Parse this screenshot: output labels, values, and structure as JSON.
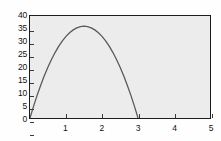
{
  "chart_data": {
    "type": "line",
    "title": "",
    "xlabel": "",
    "ylabel": "",
    "xlim": [
      0,
      5
    ],
    "ylim": [
      0,
      40
    ],
    "grid": false,
    "legend": null,
    "x_ticks": [
      "1",
      "2",
      "3",
      "4",
      "5"
    ],
    "x_tick_values": [
      1,
      2,
      3,
      4,
      5
    ],
    "y_ticks": [
      "0",
      "5",
      "10",
      "15",
      "20",
      "25",
      "30",
      "35",
      "40"
    ],
    "y_tick_values": [
      0,
      5,
      10,
      15,
      20,
      25,
      30,
      35,
      40
    ],
    "series": [
      {
        "name": "curve",
        "color": "#5a5a5a",
        "equation": "y = 16x(3 - x)",
        "x": [
          0,
          0.1,
          0.2,
          0.3,
          0.4,
          0.5,
          0.6,
          0.7,
          0.8,
          0.9,
          1.0,
          1.1,
          1.2,
          1.3,
          1.4,
          1.5,
          1.6,
          1.7,
          1.8,
          1.9,
          2.0,
          2.1,
          2.2,
          2.3,
          2.4,
          2.5,
          2.6,
          2.7,
          2.8,
          2.9,
          3.0
        ],
        "values": [
          0,
          4.64,
          8.96,
          12.96,
          16.64,
          20,
          23.04,
          25.76,
          28.16,
          30.24,
          32,
          33.44,
          34.56,
          35.36,
          35.84,
          36,
          35.84,
          35.36,
          34.56,
          33.44,
          32,
          30.24,
          28.16,
          25.76,
          23.04,
          20,
          16.64,
          12.96,
          8.96,
          4.64,
          0
        ]
      }
    ],
    "peak": {
      "x": 1.5,
      "y": 36
    },
    "roots": [
      0,
      3
    ]
  },
  "style": {
    "plot_background": "#ececec",
    "frame_color": "#1c1c1c",
    "curve_color": "#5a5a5a",
    "page_background": "#fefefe",
    "tick_color": "#3a3a3a",
    "label_color": "#111111"
  }
}
